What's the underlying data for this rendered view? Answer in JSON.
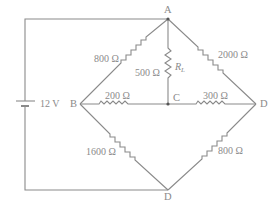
{
  "diagram": {
    "type": "Wheatstone bridge circuit",
    "colors": {
      "line": "#8a8a8a",
      "text": "#8a8a8a",
      "background": "#ffffff"
    },
    "nodes": [
      {
        "id": "A",
        "label": "A"
      },
      {
        "id": "B",
        "label": "B"
      },
      {
        "id": "C",
        "label": "C"
      },
      {
        "id": "D_right",
        "label": "D"
      },
      {
        "id": "D_bottom",
        "label": "D"
      }
    ],
    "source": {
      "label": "12 V",
      "icon": "battery-icon"
    },
    "resistors": [
      {
        "id": "r_AB",
        "between": "A-B",
        "label": "800 Ω"
      },
      {
        "id": "r_AD",
        "between": "A-D",
        "label": "2000 Ω"
      },
      {
        "id": "r_AC",
        "between": "A-C",
        "label": "500 Ω",
        "name_main": "R",
        "name_sub": "L"
      },
      {
        "id": "r_BC",
        "between": "B-C",
        "label": "200 Ω"
      },
      {
        "id": "r_CD",
        "between": "C-D",
        "label": "300 Ω"
      },
      {
        "id": "r_BD",
        "between": "B-D",
        "label": "1600 Ω"
      },
      {
        "id": "r_DD",
        "between": "D-D",
        "label": "800 Ω"
      }
    ]
  }
}
